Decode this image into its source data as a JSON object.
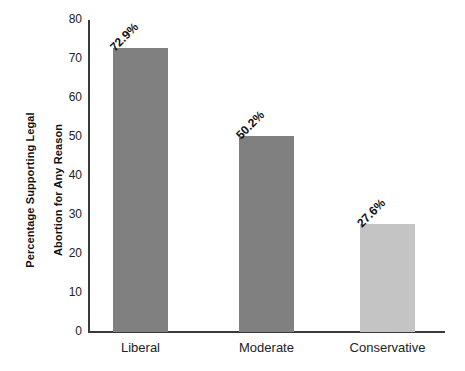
{
  "chart_data": {
    "type": "bar",
    "title": "",
    "xlabel": "",
    "ylabel": "Percentage Supporting Legal\nAbortion for Any Reason",
    "ylabel_line1": "Percentage Supporting Legal",
    "ylabel_line2": "Abortion for Any Reason",
    "categories": [
      "Liberal",
      "Moderate",
      "Conservative"
    ],
    "values": [
      72.9,
      50.2,
      27.6
    ],
    "value_labels": [
      "72.9%",
      "50.2%",
      "27.6%"
    ],
    "bar_colors": [
      "#808080",
      "#808080",
      "#c4c4c4"
    ],
    "ylim": [
      0,
      80
    ],
    "ytick_values": [
      0,
      10,
      20,
      30,
      40,
      50,
      60,
      70,
      80
    ],
    "ytick_labels": [
      "0",
      "10",
      "20",
      "30",
      "40",
      "50",
      "60",
      "70",
      "80"
    ],
    "grid": false,
    "legend": "none",
    "value_label_rotation_deg": -45,
    "axis_color": "#3a3a3a",
    "background_color": "#ffffff",
    "text_color": "#111111"
  }
}
